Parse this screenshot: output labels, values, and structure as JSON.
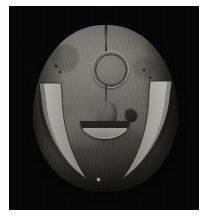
{
  "image": {
    "title": "Carved wooden mask photograph",
    "subject": "ceremonial mask",
    "medium": "black and white photograph",
    "background_color": "#040404",
    "page_color": "#ffffff",
    "plate": {
      "x": 9,
      "y": 6,
      "width": 190,
      "height": 204
    },
    "features": [
      {
        "name": "forehead-ring",
        "label": "circular ring motif",
        "color": "#efece5"
      },
      {
        "name": "left-tusk",
        "label": "left crescent tusk",
        "color": "#f2efe6"
      },
      {
        "name": "right-tusk",
        "label": "right crescent tusk",
        "color": "#f2efe6"
      },
      {
        "name": "mouth-crescent",
        "label": "crescent mouth",
        "color": "#f4f1e8"
      },
      {
        "name": "nose-ridge",
        "label": "central nose ridge",
        "color": "#b0aba3"
      },
      {
        "name": "mask-face",
        "label": "rounded mask face",
        "color": "#a09c94"
      }
    ],
    "palette": {
      "highlight": "#f4f1e8",
      "midtone": "#a09c94",
      "shadow": "#4a4843",
      "black": "#040404"
    }
  }
}
